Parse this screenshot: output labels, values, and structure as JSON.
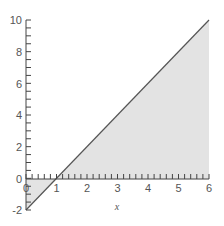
{
  "chart_data": {
    "type": "area",
    "title": "",
    "xlabel": "x",
    "ylabel": "",
    "xlim": [
      0,
      6
    ],
    "ylim": [
      -2,
      10
    ],
    "x_ticks": [
      "0",
      "1",
      "2",
      "3",
      "4",
      "5",
      "6"
    ],
    "y_ticks": [
      "-2",
      "0",
      "2",
      "4",
      "6",
      "8",
      "10"
    ],
    "grid": false,
    "legend": null,
    "series": [
      {
        "name": "y = 2x - 2",
        "x": [
          0,
          1,
          2,
          3,
          4,
          5,
          6
        ],
        "values": [
          -2,
          0,
          2,
          4,
          6,
          8,
          10
        ]
      }
    ],
    "shaded_region": "between line y = 2x - 2 and x-axis for 0 ≤ x ≤ 6",
    "colors": {
      "line": "#555555",
      "fill": "#e3e3e3",
      "axis": "#444444"
    }
  }
}
